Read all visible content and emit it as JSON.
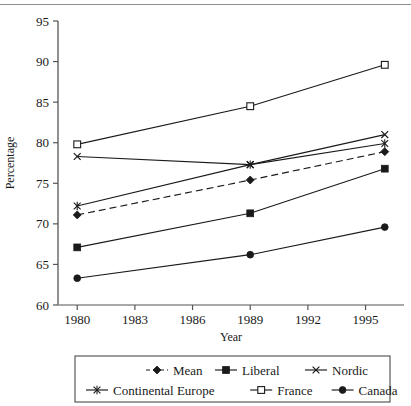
{
  "chart_data": {
    "type": "line",
    "title": "",
    "xlabel": "Year",
    "ylabel": "Percentage",
    "xlim": [
      1979,
      1997
    ],
    "ylim": [
      60,
      95
    ],
    "xticks": [
      1980,
      1983,
      1986,
      1989,
      1992,
      1995
    ],
    "yticks": [
      60,
      65,
      70,
      75,
      80,
      85,
      90,
      95
    ],
    "grid": false,
    "legend_position": "bottom",
    "x": [
      1980,
      1989,
      1996
    ],
    "series": [
      {
        "name": "Mean",
        "marker": "filled-diamond",
        "linestyle": "dashed",
        "values": [
          71.1,
          75.4,
          78.9
        ]
      },
      {
        "name": "Liberal",
        "marker": "filled-square",
        "linestyle": "solid",
        "values": [
          67.1,
          71.3,
          76.8
        ]
      },
      {
        "name": "Nordic",
        "marker": "x-cross",
        "linestyle": "solid",
        "values": [
          78.3,
          77.3,
          81.0
        ]
      },
      {
        "name": "Continental Europe",
        "marker": "asterisk",
        "linestyle": "solid",
        "values": [
          72.2,
          77.3,
          79.9
        ]
      },
      {
        "name": "France",
        "marker": "open-square",
        "linestyle": "solid",
        "values": [
          79.8,
          84.5,
          89.6
        ]
      },
      {
        "name": "Canada",
        "marker": "filled-circle",
        "linestyle": "solid",
        "values": [
          63.3,
          66.2,
          69.6
        ]
      }
    ]
  },
  "axis": {
    "y_tick_labels": [
      "95",
      "90",
      "85",
      "80",
      "75",
      "70",
      "65",
      "60"
    ],
    "x_tick_labels": [
      "1980",
      "1983",
      "1986",
      "1989",
      "1992",
      "1995"
    ],
    "y_title": "Percentage",
    "x_title": "Year"
  },
  "legend": {
    "row1": [
      {
        "label": "Mean",
        "marker": "filled-diamond",
        "linestyle": "dashed"
      },
      {
        "label": "Liberal",
        "marker": "filled-square",
        "linestyle": "solid"
      },
      {
        "label": "Nordic",
        "marker": "x-cross",
        "linestyle": "solid"
      }
    ],
    "row2": [
      {
        "label": "Continental Europe",
        "marker": "asterisk",
        "linestyle": "solid"
      },
      {
        "label": "France",
        "marker": "open-square",
        "linestyle": "solid"
      },
      {
        "label": "Canada",
        "marker": "filled-circle",
        "linestyle": "solid"
      }
    ]
  },
  "colors": {
    "line": "#1a1a1a",
    "text": "#1a1a1a",
    "axis": "#555555",
    "rule": "#8c8c8c",
    "background": "#ffffff"
  }
}
